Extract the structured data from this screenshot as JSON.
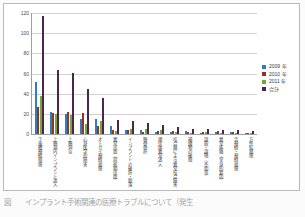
{
  "chart_data": {
    "type": "bar",
    "title": "",
    "xlabel": "",
    "ylabel": "",
    "ylim": [
      0,
      120
    ],
    "yticks": [
      0,
      20,
      40,
      60,
      80,
      100,
      120
    ],
    "grid": true,
    "legend_position": "right",
    "categories": [
      "下歯槽神経損傷",
      "上顎洞内インプラント迷入",
      "上顎洞炎",
      "心身医学的障害",
      "オトガイ神経損傷",
      "異常出血（周術期出血）",
      "インプラントの破折・脱落",
      "顎骨骨折",
      "埋伏体異常迷入",
      "咬合痛による異常咬合障害",
      "補綴物の破損",
      "誤飲・誤嚥（不明等）",
      "異常疼痛（全身的要因）",
      "舌神経・神経損傷",
      "方件結損傷"
    ],
    "series": [
      {
        "name": "2009 年",
        "color": "#2e7fbf",
        "values": [
          52,
          22,
          20,
          15,
          15,
          8,
          4,
          4,
          2,
          2,
          3,
          1,
          2,
          2,
          1
        ]
      },
      {
        "name": "2010 年",
        "color": "#9c3025",
        "values": [
          27,
          21,
          22,
          21,
          8,
          4,
          4,
          2,
          3,
          3,
          2,
          2,
          3,
          2,
          1
        ]
      },
      {
        "name": "2011 年",
        "color": "#74a83a",
        "values": [
          38,
          20,
          19,
          10,
          13,
          3,
          5,
          5,
          4,
          2,
          1,
          2,
          1,
          1,
          1
        ]
      },
      {
        "name": "合計",
        "color": "#4c2450",
        "values": [
          117,
          63,
          61,
          45,
          36,
          14,
          13,
          11,
          9,
          7,
          5,
          5,
          4,
          4,
          3
        ]
      }
    ]
  },
  "legend": {
    "items": [
      {
        "label": "2009 年",
        "color": "#2e7fbf"
      },
      {
        "label": "2010 年",
        "color": "#9c3025"
      },
      {
        "label": "2011 年",
        "color": "#74a83a"
      },
      {
        "label": "合計",
        "color": "#4c2450"
      }
    ]
  },
  "caption": "図　　インプラント手術関連の医療トラブルについて（発生"
}
